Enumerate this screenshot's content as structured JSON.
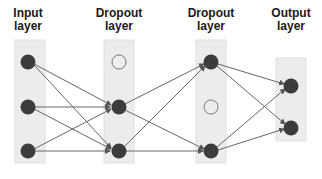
{
  "layers": [
    {
      "label_line1": "Input",
      "label_line2": "layer"
    },
    {
      "label_line1": "Dropout",
      "label_line2": "layer"
    },
    {
      "label_line1": "Dropout",
      "label_line2": "layer"
    },
    {
      "label_line1": "Output",
      "label_line2": "layer"
    }
  ],
  "colors": {
    "node": "#3c3c3c",
    "dropped_node_fill": "#eeeeee",
    "dropped_node_stroke": "#777777",
    "layer_bg": "#ececec",
    "edge": "#666666"
  }
}
